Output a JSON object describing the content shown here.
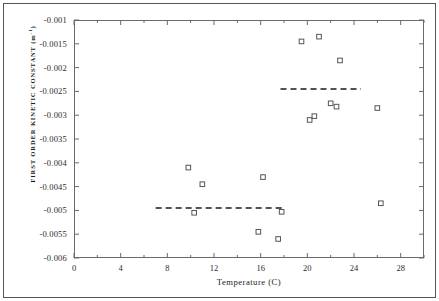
{
  "chart_data": {
    "type": "scatter",
    "title": "",
    "xlabel": "Temperature (C)",
    "ylabel": "FIRST ORDER KINETIC CONSTANT (m",
    "ylabel_exponent": "-1",
    "ylabel_suffix": ")",
    "xlim": [
      0,
      30
    ],
    "ylim": [
      -0.006,
      -0.001
    ],
    "grid": false,
    "legend": false,
    "marker": "open-square",
    "marker_color": "#555555",
    "xticks": [
      0,
      4,
      8,
      12,
      16,
      20,
      24,
      28
    ],
    "xtick_labels": [
      "0",
      "4",
      "8",
      "12",
      "16",
      "20",
      "24",
      "28"
    ],
    "xminor_interval": 2,
    "yticks": [
      -0.001,
      -0.0015,
      -0.002,
      -0.0025,
      -0.003,
      -0.0035,
      -0.004,
      -0.0045,
      -0.005,
      -0.0055,
      -0.006
    ],
    "ytick_labels": [
      "-0.001",
      "-0.0015",
      "-0.002",
      "-0.0025",
      "-0.003",
      "-0.0035",
      "-0.004",
      "-0.0045",
      "-0.005",
      "-0.0055",
      "-0.006"
    ],
    "points": [
      {
        "x": 9.8,
        "y": -0.0041
      },
      {
        "x": 10.3,
        "y": -0.00505
      },
      {
        "x": 11.0,
        "y": -0.00445
      },
      {
        "x": 15.8,
        "y": -0.00545
      },
      {
        "x": 16.2,
        "y": -0.0043
      },
      {
        "x": 17.5,
        "y": -0.0056
      },
      {
        "x": 17.8,
        "y": -0.00503
      },
      {
        "x": 19.5,
        "y": -0.00145
      },
      {
        "x": 20.2,
        "y": -0.0031
      },
      {
        "x": 20.6,
        "y": -0.00302
      },
      {
        "x": 21.0,
        "y": -0.00135
      },
      {
        "x": 22.0,
        "y": -0.00275
      },
      {
        "x": 22.5,
        "y": -0.00282
      },
      {
        "x": 22.8,
        "y": -0.00185
      },
      {
        "x": 26.0,
        "y": -0.00285
      },
      {
        "x": 26.3,
        "y": -0.00485
      }
    ],
    "reference_lines": [
      {
        "name": "low-temperature-mean",
        "y": -0.00495,
        "x_start": 7.0,
        "x_end": 18.0,
        "style": "dashed"
      },
      {
        "name": "high-temperature-mean",
        "y": -0.00245,
        "x_start": 17.7,
        "x_end": 24.6,
        "style": "dashed"
      }
    ]
  }
}
